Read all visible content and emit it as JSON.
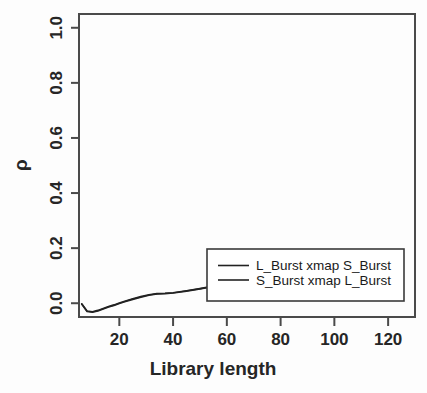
{
  "chart_data": {
    "type": "line",
    "title": "",
    "xlabel": "Library length",
    "ylabel": "ρ",
    "xlim": [
      5,
      130
    ],
    "ylim": [
      -0.05,
      1.05
    ],
    "xticks": [
      20,
      40,
      60,
      80,
      100,
      120
    ],
    "xtick_labels": [
      "20",
      "40",
      "60",
      "80",
      "100",
      "120"
    ],
    "yticks": [
      0.0,
      0.2,
      0.4,
      0.6,
      0.8,
      1.0
    ],
    "ytick_labels": [
      "0.0",
      "0.2",
      "0.4",
      "0.6",
      "0.8",
      "1.0"
    ],
    "grid": false,
    "legend_position": "bottom-right",
    "series": [
      {
        "name": "L_Burst xmap S_Burst",
        "x": [
          6,
          8,
          10,
          12,
          14,
          16,
          18,
          20,
          22,
          25,
          28,
          31,
          34,
          37,
          40,
          45,
          50,
          55,
          60,
          65,
          70,
          75,
          80,
          85,
          90,
          95,
          100,
          105,
          110,
          115,
          120,
          124
        ],
        "y": [
          -0.002,
          -0.028,
          -0.031,
          -0.026,
          -0.019,
          -0.012,
          -0.006,
          0.001,
          0.007,
          0.016,
          0.024,
          0.031,
          0.035,
          0.036,
          0.038,
          0.045,
          0.053,
          0.062,
          0.07,
          0.074,
          0.078,
          0.082,
          0.086,
          0.091,
          0.096,
          0.101,
          0.106,
          0.112,
          0.118,
          0.124,
          0.13,
          0.134
        ]
      },
      {
        "name": "S_Burst xmap L_Burst",
        "x": [
          6,
          8,
          10,
          12,
          14,
          16,
          18,
          20,
          22,
          25,
          28,
          31,
          34,
          37,
          40,
          45,
          50,
          55,
          60,
          65,
          70,
          75,
          80,
          85,
          90,
          95,
          100,
          105,
          110,
          115,
          120,
          124
        ],
        "y": [
          -0.003,
          -0.03,
          -0.033,
          -0.028,
          -0.021,
          -0.014,
          -0.008,
          -0.001,
          0.005,
          0.014,
          0.022,
          0.029,
          0.034,
          0.035,
          0.037,
          0.044,
          0.052,
          0.061,
          0.069,
          0.073,
          0.077,
          0.081,
          0.085,
          0.09,
          0.095,
          0.1,
          0.105,
          0.111,
          0.117,
          0.123,
          0.129,
          0.133
        ]
      }
    ],
    "legend": [
      {
        "label": "L_Burst xmap S_Burst",
        "color": "#222222"
      },
      {
        "label": "S_Burst xmap L_Burst",
        "color": "#222222"
      }
    ]
  }
}
